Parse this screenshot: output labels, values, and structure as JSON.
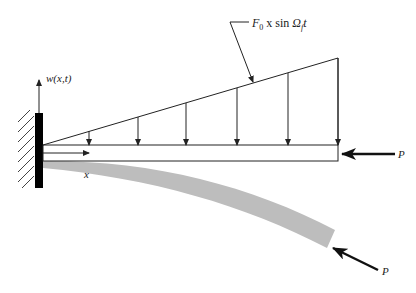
{
  "diagram": {
    "type": "cantilever-beam-schematic",
    "labels": {
      "deflection": "w(x,t)",
      "axis_x": "x",
      "load": "F",
      "load_sub": "0",
      "load_mid": " x sin ",
      "load_omega": "Ω",
      "load_omega_sub": "f",
      "load_t": "t",
      "axial_force_top": "P",
      "axial_force_bottom": "P"
    },
    "load_arrows_x": [
      89,
      138,
      186,
      237,
      288,
      338
    ],
    "colors": {
      "line": "#222222",
      "wall": "#000000",
      "deflected_beam": "#bdbdbd"
    }
  }
}
